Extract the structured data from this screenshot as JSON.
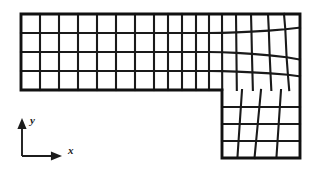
{
  "figure": {
    "background_color": "#ffffff",
    "line_color": "#1a1a1a",
    "boundary_color": "#111111"
  },
  "axes_indicator": {
    "name": "coordinate-axes",
    "origin": [
      22,
      156
    ],
    "x_axis": {
      "label": "x",
      "tip": [
        62,
        156
      ],
      "label_pos": [
        68,
        154
      ]
    },
    "y_axis": {
      "label": "y",
      "tip": [
        22,
        118
      ],
      "label_pos": [
        30,
        124
      ]
    },
    "arrow_size": 4.6
  },
  "chart_data": {
    "type": "mesh",
    "xlabel": "x",
    "ylabel": "y",
    "domain_outline": [
      [
        21,
        14
      ],
      [
        300,
        14
      ],
      [
        300,
        158
      ],
      [
        222,
        158
      ],
      [
        222,
        90
      ],
      [
        21,
        90
      ]
    ],
    "upper_arm": {
      "x_left": 21,
      "x_right": 300,
      "y_top": 14,
      "y_bottom": 90,
      "rows": 4,
      "row_y": [
        14,
        33,
        52,
        71,
        90
      ],
      "col_x": [
        21,
        40,
        59,
        78,
        97,
        116,
        135,
        154,
        168,
        182,
        196,
        209,
        222,
        236,
        251,
        268,
        284,
        300
      ],
      "skew": {
        "start_col_index": 11,
        "max_row_offset": 9.0,
        "max_col_offset": 7.5
      }
    },
    "lower_leg": {
      "x_left": 222,
      "x_right": 300,
      "y_top": 90,
      "y_bottom": 158,
      "rows": 4,
      "row_y": [
        90,
        107,
        124,
        141,
        158
      ],
      "col_x": [
        222,
        242,
        261,
        281,
        300
      ],
      "skew": {
        "max_col_offset": 6.5
      }
    }
  }
}
